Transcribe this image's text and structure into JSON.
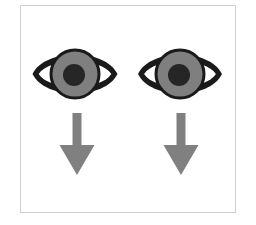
{
  "canvas": {
    "width": 256,
    "height": 225,
    "background_color": "#ffffff",
    "title": "Eyes Looking Down"
  },
  "frame": {
    "name": "card-frame",
    "x": 20,
    "y": 5,
    "width": 216,
    "height": 208,
    "border_color": "#cfcfcf",
    "fill_color": "#ffffff",
    "border_width": 1
  },
  "palette": {
    "outline_black": "#1a1a1a",
    "iris_gray": "#7f7f7f",
    "pupil_dark": "#262626",
    "arrow_gray": "#808080",
    "frame_gray": "#cfcfcf",
    "background_white": "#ffffff"
  },
  "symbols": [
    {
      "id": "left-eye",
      "label": "Left eye",
      "icon": "eye-icon",
      "cx": 75,
      "cy": 74,
      "width": 85,
      "height": 52,
      "iris_radius": 23,
      "pupil_radius": 11,
      "outline_color": "#1a1a1a",
      "iris_color": "#7f7f7f",
      "pupil_color": "#262626"
    },
    {
      "id": "right-eye",
      "label": "Right eye",
      "icon": "eye-icon",
      "cx": 180,
      "cy": 74,
      "width": 84,
      "height": 52,
      "iris_radius": 23,
      "pupil_radius": 11,
      "outline_color": "#1a1a1a",
      "iris_color": "#7f7f7f",
      "pupil_color": "#262626"
    },
    {
      "id": "left-arrow",
      "label": "Left downward arrow",
      "icon": "arrow-down-icon",
      "cx": 77,
      "top": 113,
      "tip": 175,
      "shaft_width": 9,
      "head_width": 35,
      "head_height": 30,
      "color": "#808080"
    },
    {
      "id": "right-arrow",
      "label": "Right downward arrow",
      "icon": "arrow-down-icon",
      "cx": 181,
      "top": 113,
      "tip": 175,
      "shaft_width": 9,
      "head_width": 35,
      "head_height": 30,
      "color": "#808080"
    }
  ],
  "meaning": {
    "alt_text": "Two eyes above two downward arrows",
    "caption": ""
  }
}
